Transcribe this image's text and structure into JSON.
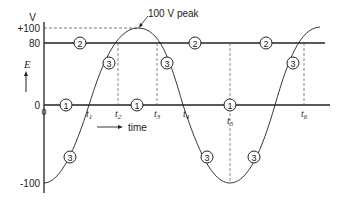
{
  "diagram": {
    "y_axis": {
      "unit_label": "V",
      "symbol": "E",
      "ticks": [
        {
          "label": "+100",
          "value": 100
        },
        {
          "label": "80",
          "value": 80
        },
        {
          "label": "0",
          "value": 0
        },
        {
          "label": "-100",
          "value": -100
        }
      ]
    },
    "x_axis": {
      "origin_label": "0",
      "time_label": "time",
      "time_points": [
        "t1",
        "t2",
        "t3",
        "t4",
        "t5",
        "t6"
      ]
    },
    "annotation": {
      "peak_label": "100 V peak"
    },
    "markers": {
      "line1": "1",
      "line2": "2",
      "curve3": "3"
    },
    "colors": {
      "line": "#222222",
      "dashed": "#555555",
      "background": "#ffffff"
    }
  }
}
